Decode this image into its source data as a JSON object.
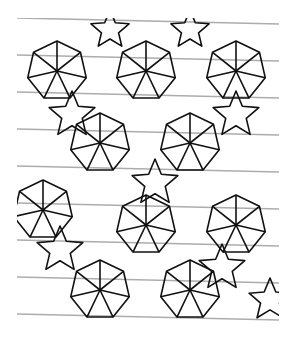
{
  "figure": {
    "stroke_color": "#111111",
    "background": "#ffffff",
    "bounds": {
      "x": 17,
      "y": 18,
      "width": 262,
      "height": 305
    },
    "wheels": [
      {
        "cx": 57,
        "cy": 71,
        "r": 30
      },
      {
        "cx": 146,
        "cy": 71,
        "r": 30
      },
      {
        "cx": 236,
        "cy": 71,
        "r": 30
      },
      {
        "cx": 100,
        "cy": 143,
        "r": 30
      },
      {
        "cx": 190,
        "cy": 143,
        "r": 30
      },
      {
        "cx": 43,
        "cy": 210,
        "r": 30
      },
      {
        "cx": 146,
        "cy": 225,
        "r": 30
      },
      {
        "cx": 236,
        "cy": 225,
        "r": 30
      },
      {
        "cx": 100,
        "cy": 290,
        "r": 30
      },
      {
        "cx": 190,
        "cy": 290,
        "r": 30
      }
    ],
    "stars": [
      {
        "cx": 72,
        "cy": 115,
        "r": 24
      },
      {
        "cx": 236,
        "cy": 115,
        "r": 24
      },
      {
        "cx": 155,
        "cy": 183,
        "r": 24
      },
      {
        "cx": 60,
        "cy": 250,
        "r": 24
      },
      {
        "cx": 222,
        "cy": 268,
        "r": 24
      },
      {
        "cx": 110,
        "cy": 30,
        "r": 20
      },
      {
        "cx": 190,
        "cy": 30,
        "r": 20
      },
      {
        "cx": 270,
        "cy": 300,
        "r": 22
      }
    ]
  }
}
